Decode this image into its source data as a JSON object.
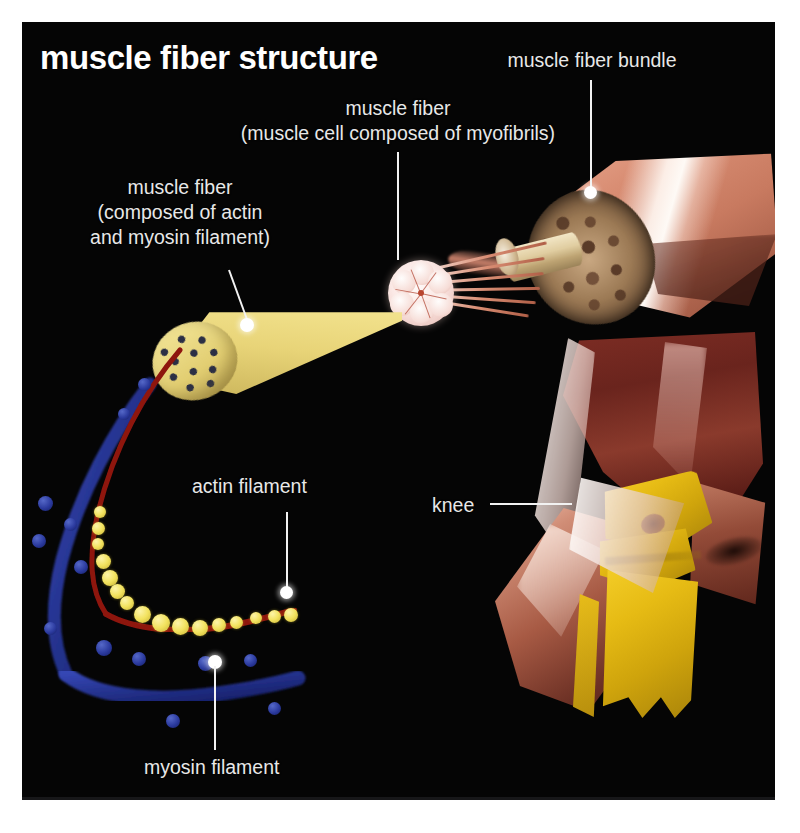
{
  "page": {
    "background_color": "#ffffff",
    "panel_color": "#050505"
  },
  "title": "muscle fiber structure",
  "labels": {
    "bundle": "muscle fiber bundle",
    "fiber_cell_line1": "muscle fiber",
    "fiber_cell_line2": "(muscle cell composed of myofibrils)",
    "fiber_filament_line1": "muscle fiber",
    "fiber_filament_line2": "(composed of actin",
    "fiber_filament_line3": "and myosin filament)",
    "actin": "actin filament",
    "myosin": "myosin filament",
    "knee": "knee"
  },
  "colors": {
    "text": "#e8e8e8",
    "title_text": "#ffffff",
    "leader_line": "#f2f2f2",
    "actin_bead": "#f2e25e",
    "actin_strand": "#8e1410",
    "myosin": "#22318f",
    "fiber_cone": "#f2e28d",
    "bundle_muscle": "#c87a60",
    "bone_yellow": "#e6bb14",
    "thigh_muscle": "#6a241d",
    "tendon": "#fffcfa"
  },
  "structures": [
    {
      "name": "muscle-fiber-bundle",
      "note": "cut wedge of muscle showing mottled cross-section face"
    },
    {
      "name": "myofibril-cell",
      "note": "round pale cell drawn out of the bundle"
    },
    {
      "name": "muscle-fiber-cone",
      "note": "yellow tapering fiber with speckled cut end"
    },
    {
      "name": "actin-filament",
      "note": "yellow beads on dark red strand"
    },
    {
      "name": "myosin-filament",
      "note": "blue textured rod with projecting heads"
    },
    {
      "name": "knee-joint",
      "note": "leg muscles, tendons and yellow bones at the knee"
    }
  ]
}
